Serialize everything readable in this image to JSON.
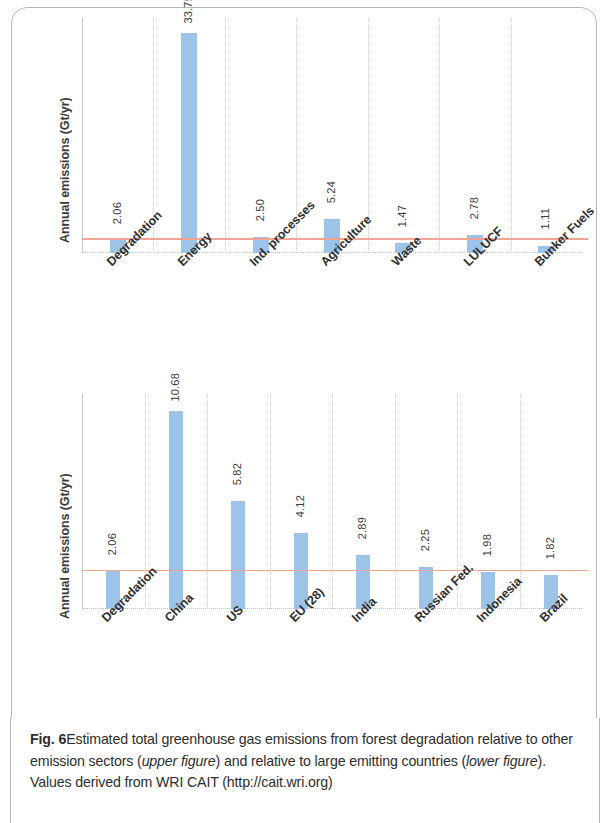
{
  "figure": {
    "label": "Fig. 6",
    "caption_part_1": "Estimated total greenhouse gas emissions from forest degradation relative to other emission sectors (",
    "caption_em_1": "upper figure",
    "caption_part_2": ") and relative to large emitting countries (",
    "caption_em_2": "lower figure",
    "caption_part_3": "). Values derived from WRI CAIT (http://cait.wri.org)"
  },
  "colors": {
    "bar": "#9dc3e9",
    "reference_line": "#f0a090",
    "gridline": "#d2d2d2",
    "text": "#2f2f2f"
  },
  "chart_data": [
    {
      "type": "bar",
      "id": "upper",
      "title": "",
      "xlabel": "",
      "ylabel": "Annual emissions (Gt/yr)",
      "ylim": [
        0,
        36
      ],
      "grid": true,
      "legend": "none",
      "reference_line_value": 2.06,
      "reference_line_label": "Degradation",
      "categories": [
        "Degradation",
        "Energy",
        "Ind. processes",
        "Agriculture",
        "Waste",
        "LULUCF",
        "Bunker Fuels"
      ],
      "values": [
        2.06,
        33.75,
        2.5,
        5.24,
        1.47,
        2.78,
        1.11
      ],
      "value_labels": [
        "2.06",
        "33.75",
        "2.50",
        "5.24",
        "1.47",
        "2.78",
        "1.11"
      ]
    },
    {
      "type": "bar",
      "id": "lower",
      "title": "",
      "xlabel": "",
      "ylabel": "Annual emissions (Gt/yr)",
      "ylim": [
        0,
        11.6
      ],
      "grid": true,
      "legend": "none",
      "reference_line_value": 2.06,
      "reference_line_label": "Degradation",
      "categories": [
        "Degradation",
        "China",
        "US",
        "EU (28)",
        "India",
        "Russian Fed.",
        "Indonesia",
        "Brazil"
      ],
      "values": [
        2.06,
        10.68,
        5.82,
        4.12,
        2.89,
        2.25,
        1.98,
        1.82
      ],
      "value_labels": [
        "2.06",
        "10.68",
        "5.82",
        "4.12",
        "2.89",
        "2.25",
        "1.98",
        "1.82"
      ]
    }
  ]
}
